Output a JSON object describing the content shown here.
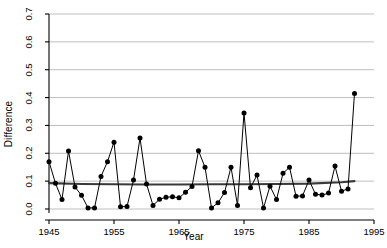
{
  "chart_data": {
    "type": "line",
    "title": "",
    "xlabel": "Year",
    "ylabel": "Difference",
    "xlim": [
      1945,
      1995
    ],
    "ylim": [
      0.0,
      0.7
    ],
    "xticks": [
      1945,
      1955,
      1965,
      1975,
      1985,
      1995
    ],
    "yticks": [
      0.0,
      0.1,
      0.2,
      0.3,
      0.4,
      0.5,
      0.6,
      0.7
    ],
    "xtick_labels": [
      "1945",
      "1955",
      "1965",
      "1975",
      "1985",
      "1995"
    ],
    "ytick_labels": [
      "0.0",
      "0.1",
      "0.2",
      "0.3",
      "0.4",
      "0.5",
      "0.6",
      "0.7"
    ],
    "grid": true,
    "grid_axis": "y",
    "grid_color": "#bfbfbf",
    "legend": false,
    "marker": "filled-circle",
    "marker_color": "#000000",
    "line_color": "#000000",
    "series": [
      {
        "name": "Difference",
        "x": [
          1945,
          1946,
          1947,
          1948,
          1949,
          1950,
          1951,
          1952,
          1953,
          1954,
          1955,
          1956,
          1957,
          1958,
          1959,
          1960,
          1961,
          1962,
          1963,
          1964,
          1965,
          1966,
          1967,
          1968,
          1969,
          1970,
          1971,
          1972,
          1973,
          1974,
          1975,
          1976,
          1977,
          1978,
          1979,
          1980,
          1981,
          1982,
          1983,
          1984,
          1985,
          1986,
          1987,
          1988,
          1989,
          1990,
          1991,
          1992
        ],
        "values": [
          0.17,
          0.092,
          0.034,
          0.208,
          0.079,
          0.049,
          0.004,
          0.004,
          0.117,
          0.17,
          0.24,
          0.008,
          0.009,
          0.104,
          0.255,
          0.09,
          0.013,
          0.035,
          0.042,
          0.044,
          0.04,
          0.06,
          0.081,
          0.209,
          0.15,
          0.004,
          0.022,
          0.059,
          0.15,
          0.013,
          0.345,
          0.076,
          0.122,
          0.004,
          0.082,
          0.034,
          0.128,
          0.15,
          0.046,
          0.047,
          0.104,
          0.053,
          0.05,
          0.057,
          0.154,
          0.064,
          0.072,
          0.415
        ]
      },
      {
        "name": "Smooth trend",
        "type": "smooth",
        "line_color": "#3a3a3a",
        "x": [
          1945,
          1950,
          1955,
          1960,
          1965,
          1970,
          1975,
          1980,
          1985,
          1990,
          1992
        ],
        "values": [
          0.093,
          0.09,
          0.089,
          0.088,
          0.088,
          0.089,
          0.089,
          0.09,
          0.091,
          0.096,
          0.1
        ]
      }
    ]
  }
}
